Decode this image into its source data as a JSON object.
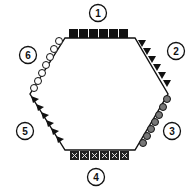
{
  "diagram": {
    "shape": "hexagon",
    "edges": [
      {
        "id": 1,
        "label": "1",
        "pattern": "filled-squares"
      },
      {
        "id": 2,
        "label": "2",
        "pattern": "filled-triangles"
      },
      {
        "id": 3,
        "label": "3",
        "pattern": "striped-circles"
      },
      {
        "id": 4,
        "label": "4",
        "pattern": "crossed-squares"
      },
      {
        "id": 5,
        "label": "5",
        "pattern": "filled-triangles"
      },
      {
        "id": 6,
        "label": "6",
        "pattern": "open-circles"
      }
    ]
  }
}
